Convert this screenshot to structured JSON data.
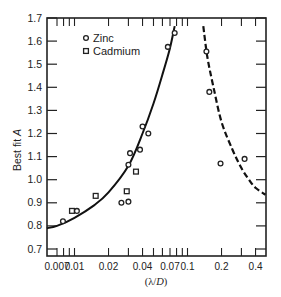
{
  "chart_data": {
    "type": "scatter",
    "title": "",
    "xlabel": "(λ/D)",
    "ylabel": "Best fit A",
    "xscale": "log",
    "xlim": [
      0.0057,
      0.49
    ],
    "ylim": [
      0.7,
      1.7
    ],
    "grid": false,
    "legend_position": "upper left",
    "x_tick_labels": [
      "0.007",
      "0.01",
      "0.02",
      "0.04",
      "0.07",
      "0.1",
      "0.2",
      "0.4"
    ],
    "x_ticks": [
      0.007,
      0.01,
      0.02,
      0.04,
      0.07,
      0.1,
      0.2,
      0.4
    ],
    "y_tick_labels": [
      "0.7",
      "0.8",
      "0.9",
      "1.0",
      "1.1",
      "1.2",
      "1.3",
      "1.4",
      "1.5",
      "1.6",
      "1.7"
    ],
    "y_ticks": [
      0.7,
      0.8,
      0.9,
      1.0,
      1.1,
      1.2,
      1.3,
      1.4,
      1.5,
      1.6,
      1.7
    ],
    "series": [
      {
        "name": "Zinc",
        "marker": "circle",
        "points": [
          {
            "x": 0.0079,
            "y": 0.82
          },
          {
            "x": 0.0105,
            "y": 0.865
          },
          {
            "x": 0.026,
            "y": 0.9
          },
          {
            "x": 0.03,
            "y": 0.905
          },
          {
            "x": 0.03,
            "y": 1.065
          },
          {
            "x": 0.031,
            "y": 1.115
          },
          {
            "x": 0.038,
            "y": 1.13
          },
          {
            "x": 0.04,
            "y": 1.23
          },
          {
            "x": 0.045,
            "y": 1.2
          },
          {
            "x": 0.067,
            "y": 1.575
          },
          {
            "x": 0.077,
            "y": 1.635
          },
          {
            "x": 0.147,
            "y": 1.555
          },
          {
            "x": 0.156,
            "y": 1.38
          },
          {
            "x": 0.196,
            "y": 1.07
          },
          {
            "x": 0.32,
            "y": 1.09
          }
        ]
      },
      {
        "name": "Cadmium",
        "marker": "square",
        "points": [
          {
            "x": 0.0095,
            "y": 0.865
          },
          {
            "x": 0.0154,
            "y": 0.93
          },
          {
            "x": 0.029,
            "y": 0.95
          },
          {
            "x": 0.035,
            "y": 1.035
          }
        ]
      }
    ],
    "curves": [
      {
        "name": "fit-left",
        "style": "solid",
        "points": [
          [
            0.0057,
            0.79
          ],
          [
            0.007,
            0.8
          ],
          [
            0.01,
            0.835
          ],
          [
            0.015,
            0.89
          ],
          [
            0.02,
            0.945
          ],
          [
            0.03,
            1.06
          ],
          [
            0.04,
            1.2
          ],
          [
            0.05,
            1.33
          ],
          [
            0.06,
            1.455
          ],
          [
            0.07,
            1.57
          ],
          [
            0.077,
            1.665
          ]
        ]
      },
      {
        "name": "fit-right",
        "style": "dashed",
        "points": [
          [
            0.138,
            1.665
          ],
          [
            0.15,
            1.53
          ],
          [
            0.17,
            1.4
          ],
          [
            0.2,
            1.25
          ],
          [
            0.25,
            1.13
          ],
          [
            0.3,
            1.05
          ],
          [
            0.35,
            1.0
          ],
          [
            0.4,
            0.965
          ],
          [
            0.49,
            0.935
          ]
        ]
      }
    ]
  },
  "legend": {
    "items": [
      {
        "label": "Zinc",
        "marker": "circle"
      },
      {
        "label": "Cadmium",
        "marker": "square"
      }
    ]
  },
  "axes": {
    "xlabel_prefix": "(λ/",
    "xlabel_var": "D",
    "xlabel_suffix": ")",
    "ylabel_text": "Best fit ",
    "ylabel_var": "A"
  }
}
